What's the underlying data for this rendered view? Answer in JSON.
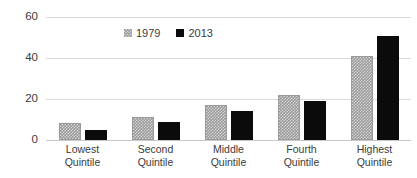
{
  "chart_data": {
    "type": "bar",
    "title": "",
    "subtitle": "",
    "xlabel": "",
    "ylabel": "",
    "grid": true,
    "legend_position": "top-center",
    "categories": [
      "Lowest Quintile",
      "Second Quintile",
      "Middle Quintile",
      "Fourth Quintile",
      "Highest Quintile"
    ],
    "category_lines": [
      [
        "Lowest",
        "Quintile"
      ],
      [
        "Second",
        "Quintile"
      ],
      [
        "Middle",
        "Quintile"
      ],
      [
        "Fourth",
        "Quintile"
      ],
      [
        "Highest",
        "Quintile"
      ]
    ],
    "series": [
      {
        "name": "1979",
        "color": "#9a9a9a",
        "pattern": "checkered",
        "values": [
          8.5,
          11,
          17,
          22,
          41
        ]
      },
      {
        "name": "2013",
        "color": "#0b0b0b",
        "pattern": "solid",
        "values": [
          5,
          9,
          14,
          19,
          50.5
        ]
      }
    ],
    "ylim": [
      0,
      60
    ],
    "yticks": [
      0,
      20,
      40,
      60
    ],
    "ytick_labels": [
      "0",
      "20",
      "40",
      "60"
    ]
  },
  "legend": {
    "entries": [
      {
        "label": "1979",
        "swatch": "legend-swatch-1979"
      },
      {
        "label": "2013",
        "swatch": "legend-swatch-2013"
      }
    ]
  },
  "axes": {
    "y": {
      "labels": [
        "60",
        "40",
        "20",
        "0"
      ]
    }
  },
  "colors": {
    "series_1979": "#9a9a9a",
    "series_2013": "#0b0b0b",
    "gridline": "#d9d9d9",
    "text": "#3b3b3b",
    "background": "#ffffff"
  }
}
